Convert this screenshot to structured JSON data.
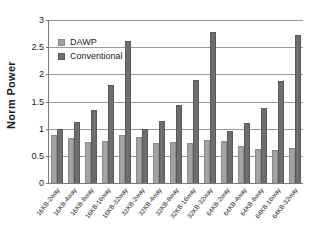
{
  "chart_data": {
    "type": "bar",
    "title": "",
    "xlabel": "",
    "ylabel": "Norm Power",
    "ylim": [
      0,
      3
    ],
    "yticks": [
      "0",
      "0.5",
      "1",
      "1.5",
      "2",
      "2.5",
      "3"
    ],
    "ytick_values": [
      0,
      0.5,
      1,
      1.5,
      2,
      2.5,
      3
    ],
    "grid": true,
    "legend_position": "upper-left-inside",
    "categories": [
      "16KB-2way",
      "16KB-4way",
      "16KB-8way",
      "16KB-16way",
      "16KB-32way",
      "32KB-2way",
      "32KB-4way",
      "32KB-8way",
      "32KB-16way",
      "32KB-32way",
      "64KB-2way",
      "64KB-4way",
      "64KB-8way",
      "64KB-16way",
      "64KB-32way"
    ],
    "series": [
      {
        "name": "DAWP",
        "color": "#a3a3a3",
        "values": [
          0.88,
          0.82,
          0.76,
          0.78,
          0.89,
          0.84,
          0.73,
          0.75,
          0.74,
          0.8,
          0.78,
          0.68,
          0.63,
          0.61,
          0.64
        ]
      },
      {
        "name": "Conventional",
        "color": "#6e6e6e",
        "values": [
          1.0,
          1.13,
          1.35,
          1.8,
          2.62,
          1.0,
          1.15,
          1.44,
          1.9,
          2.78,
          0.96,
          1.11,
          1.38,
          1.88,
          2.72
        ]
      }
    ]
  },
  "legend": {
    "items": [
      {
        "label": "DAWP"
      },
      {
        "label": "Conventional"
      }
    ]
  },
  "axis": {
    "y_title": "Norm Power"
  }
}
